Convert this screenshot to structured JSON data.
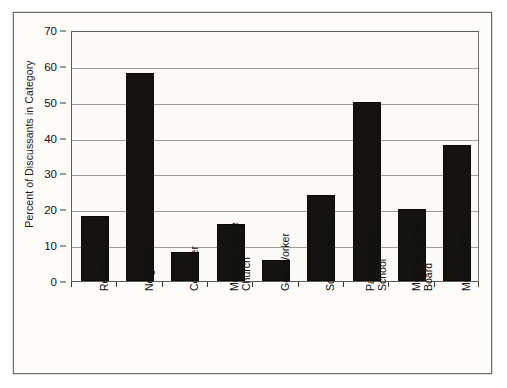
{
  "figure": {
    "background_color": "#fbfaf6",
    "frame_color": "#6f6f68",
    "bar_color": "#141310",
    "gridline_color": "#9d9d95"
  },
  "chart_data": {
    "type": "bar",
    "title": "",
    "xlabel": "",
    "ylabel": "Percent of Discussants in Category",
    "ylim": [
      0,
      70
    ],
    "ytick_values": [
      0,
      10,
      20,
      30,
      40,
      50,
      60,
      70
    ],
    "ytick_labels": [
      "0",
      "10",
      "20",
      "30",
      "40",
      "50",
      "60",
      "70"
    ],
    "grid": true,
    "legend": false,
    "categories": [
      "Relative",
      "Neighbor",
      "Coworker",
      "Member Same Church",
      "Gov. Worker",
      "School Worker",
      "Parent Same School",
      "Member School Board",
      "Member PTA"
    ],
    "category_lines": [
      [
        "Relative"
      ],
      [
        "Neighbor"
      ],
      [
        "Coworker"
      ],
      [
        "Member Same",
        "Church"
      ],
      [
        "Gov. Worker"
      ],
      [
        "School Worker"
      ],
      [
        "Parent Same",
        "School"
      ],
      [
        "Member School",
        "Board"
      ],
      [
        "Member PTA"
      ]
    ],
    "values": [
      18,
      58,
      8,
      16,
      6,
      24,
      50,
      20,
      38
    ],
    "series": [
      {
        "name": "Percent of Discussants in Category",
        "values": [
          18,
          58,
          8,
          16,
          6,
          24,
          50,
          20,
          38
        ]
      }
    ]
  }
}
